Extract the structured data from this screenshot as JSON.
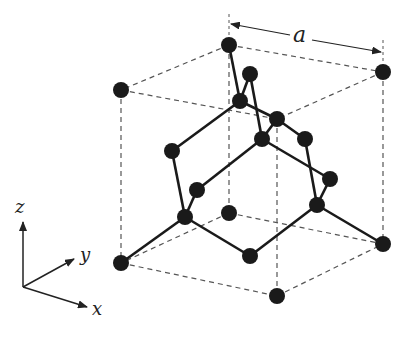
{
  "labels": {
    "lattice_constant": "a",
    "axis_x": "x",
    "axis_y": "y",
    "axis_z": "z"
  },
  "colors": {
    "atom": "#1a1a1a",
    "bond": "#1a1a1a",
    "cube_edge": "#555555",
    "background": "#ffffff"
  },
  "atoms": [
    {
      "id": "c_top_back_left",
      "x": 229,
      "y": 45
    },
    {
      "id": "c_top_back_right",
      "x": 383,
      "y": 72
    },
    {
      "id": "c_top_front_left",
      "x": 121,
      "y": 90
    },
    {
      "id": "c_top_front_right",
      "x": 277,
      "y": 119
    },
    {
      "id": "fc_top",
      "x": 250,
      "y": 74
    },
    {
      "id": "in_1",
      "x": 240,
      "y": 101
    },
    {
      "id": "in_2",
      "x": 262,
      "y": 139
    },
    {
      "id": "fc_right_upper",
      "x": 305,
      "y": 139
    },
    {
      "id": "fc_left",
      "x": 172,
      "y": 151
    },
    {
      "id": "fc_right",
      "x": 330,
      "y": 179
    },
    {
      "id": "in_3",
      "x": 197,
      "y": 190
    },
    {
      "id": "in_4",
      "x": 185,
      "y": 217
    },
    {
      "id": "c_bot_back_left",
      "x": 229,
      "y": 213
    },
    {
      "id": "in_5",
      "x": 317,
      "y": 205
    },
    {
      "id": "c_bot_front_left",
      "x": 121,
      "y": 263
    },
    {
      "id": "fc_bottom",
      "x": 250,
      "y": 256
    },
    {
      "id": "c_bot_back_right",
      "x": 383,
      "y": 244
    },
    {
      "id": "c_bot_front_right",
      "x": 277,
      "y": 296
    }
  ],
  "bonds": [
    [
      229,
      45,
      240,
      101
    ],
    [
      250,
      74,
      240,
      101
    ],
    [
      250,
      74,
      262,
      139
    ],
    [
      240,
      101,
      277,
      119
    ],
    [
      262,
      139,
      277,
      119
    ],
    [
      277,
      119,
      305,
      139
    ],
    [
      262,
      139,
      330,
      179
    ],
    [
      305,
      139,
      317,
      205
    ],
    [
      330,
      179,
      317,
      205
    ],
    [
      317,
      205,
      383,
      244
    ],
    [
      317,
      205,
      250,
      256
    ],
    [
      172,
      151,
      240,
      101
    ],
    [
      172,
      151,
      185,
      217
    ],
    [
      197,
      190,
      262,
      139
    ],
    [
      197,
      190,
      185,
      217
    ],
    [
      185,
      217,
      121,
      263
    ],
    [
      185,
      217,
      250,
      256
    ]
  ],
  "cube_edges": [
    [
      229,
      45,
      383,
      72
    ],
    [
      229,
      45,
      121,
      90
    ],
    [
      121,
      90,
      277,
      119
    ],
    [
      383,
      72,
      277,
      119
    ],
    [
      229,
      213,
      383,
      244
    ],
    [
      229,
      213,
      121,
      263
    ],
    [
      121,
      263,
      277,
      296
    ],
    [
      277,
      296,
      383,
      244
    ],
    [
      229,
      45,
      229,
      213
    ],
    [
      121,
      90,
      121,
      263
    ],
    [
      383,
      72,
      383,
      244
    ],
    [
      277,
      119,
      277,
      296
    ]
  ],
  "dimension": {
    "x1": 231,
    "y1": 24,
    "x2": 381,
    "y2": 52,
    "label_x": 300,
    "label_y": 40
  }
}
